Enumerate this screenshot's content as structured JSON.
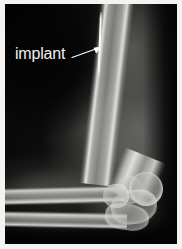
{
  "figure": {
    "name": "elbow-radiograph",
    "modality": "x-ray",
    "view": "lateral elbow",
    "alt": "Lateral radiograph of a flexed elbow showing the humerus, radius and ulna with a thin metallic implant in the distal humerus region",
    "background_color": "#0a0a0a",
    "border_color": "#f0efed"
  },
  "annotations": [
    {
      "id": "implant-annotation",
      "label": "implant",
      "label_color": "#f0f0ee",
      "label_x": 15,
      "label_y": 45,
      "arrow_color": "#ffffff",
      "arrow_from_x": 72,
      "arrow_from_y": 57,
      "arrow_to_x": 101,
      "arrow_to_y": 47
    }
  ],
  "anatomy": [
    {
      "id": "humerus-shaft",
      "label": "humerus shaft"
    },
    {
      "id": "humerus-distal",
      "label": "distal humerus"
    },
    {
      "id": "capitellum",
      "label": "capitellum"
    },
    {
      "id": "trochlea",
      "label": "trochlea"
    },
    {
      "id": "olecranon",
      "label": "olecranon"
    },
    {
      "id": "radius",
      "label": "radius"
    },
    {
      "id": "radial-head",
      "label": "radial head"
    },
    {
      "id": "ulna",
      "label": "ulna"
    }
  ],
  "devices": [
    {
      "id": "implant-rod",
      "label": "implant",
      "appearance": "thin radiodense rod"
    }
  ]
}
